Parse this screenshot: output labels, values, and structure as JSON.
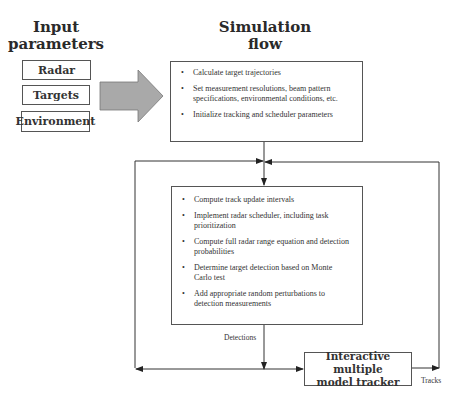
{
  "headings": {
    "input": [
      "Input",
      "parameters"
    ],
    "simulation": [
      "Simulation",
      "flow"
    ]
  },
  "inputs": [
    {
      "label": "Radar"
    },
    {
      "label": "Targets"
    },
    {
      "label": "Environment"
    }
  ],
  "setup_box": {
    "items": [
      "Calculate target trajectories",
      "Set measurement resolutions, beam pattern specifications, environmental conditions, etc.",
      "Initialize tracking and scheduler parameters"
    ]
  },
  "loop_box": {
    "items": [
      "Compute track update intervals",
      "Implement radar scheduler, including task prioritization",
      "Compute full radar range equation and detection probabilities",
      "Determine target detection based on Monte Carlo test",
      "Add appropriate random perturbations to detection measurements"
    ]
  },
  "tracker": {
    "label_line1": "Interactive multiple",
    "label_line2": "model tracker"
  },
  "edge_labels": {
    "detections": "Detections",
    "tracks": "Tracks"
  },
  "colors": {
    "arrow_fill": "#a9a9a9",
    "line": "#333333",
    "box_border": "#555555"
  }
}
